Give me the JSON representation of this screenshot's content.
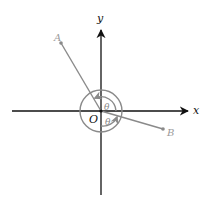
{
  "diagram": {
    "type": "coordinate-plane",
    "axes": {
      "x_label": "x",
      "y_label": "y",
      "origin_label": "O",
      "color": "#111111"
    },
    "points": [
      {
        "name": "A",
        "label": "A",
        "x": 61,
        "y": 43
      },
      {
        "name": "B",
        "label": "B",
        "x": 163,
        "y": 129
      }
    ],
    "angles": [
      {
        "label": "θ",
        "description": "angle from positive x-axis to OA (counterclockwise, upper)"
      },
      {
        "label": "θ",
        "description": "angle from positive x-axis to OB (clockwise, lower)"
      }
    ],
    "colors": {
      "segment": "#8a8a8a",
      "point_label": "#9a9a9a",
      "arc": "#8a8a8a"
    }
  }
}
